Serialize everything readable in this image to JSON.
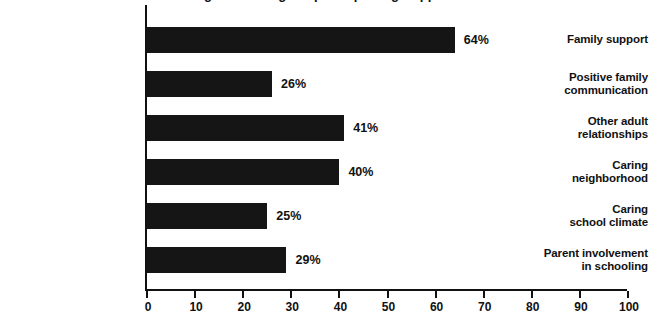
{
  "chart_data": {
    "type": "bar",
    "orientation": "horizontal",
    "title": "Percentages of Young People Reporting Support Assets",
    "xlabel": "",
    "ylabel": "",
    "xlim": [
      0,
      100
    ],
    "xticks": [
      0,
      10,
      20,
      30,
      40,
      50,
      60,
      70,
      80,
      90,
      100
    ],
    "grid": false,
    "legend": null,
    "bar_color": "#151515",
    "axis_color": "#111111",
    "categories": [
      "Family support",
      "Positive family\ncommunication",
      "Other adult\nrelationships",
      "Caring\nneighborhood",
      "Caring\nschool climate",
      "Parent involvement\nin schooling"
    ],
    "values": [
      64,
      26,
      41,
      40,
      25,
      29
    ],
    "value_labels": [
      "64%",
      "26%",
      "41%",
      "40%",
      "25%",
      "29%"
    ]
  },
  "axis": {
    "tick_labels": [
      "0",
      "10",
      "20",
      "30",
      "40",
      "50",
      "60",
      "70",
      "80",
      "90",
      "100"
    ]
  },
  "bars": [
    {
      "label_line1": "Family support",
      "label_line2": "",
      "value": 64,
      "value_label": "64%"
    },
    {
      "label_line1": "Positive family",
      "label_line2": "communication",
      "value": 26,
      "value_label": "26%"
    },
    {
      "label_line1": "Other adult",
      "label_line2": "relationships",
      "value": 41,
      "value_label": "41%"
    },
    {
      "label_line1": "Caring",
      "label_line2": "neighborhood",
      "value": 40,
      "value_label": "40%"
    },
    {
      "label_line1": "Caring",
      "label_line2": "school climate",
      "value": 25,
      "value_label": "25%"
    },
    {
      "label_line1": "Parent involvement",
      "label_line2": "in schooling",
      "value": 29,
      "value_label": "29%"
    }
  ]
}
